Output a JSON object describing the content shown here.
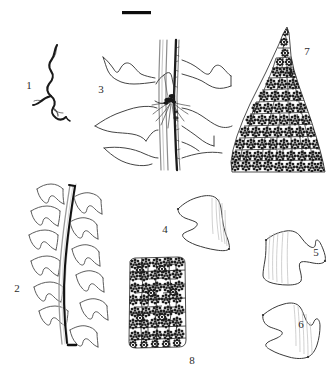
{
  "figure": {
    "kind": "scientific-illustration-plate",
    "caption_text": "",
    "background_color": "#ffffff",
    "ink_color": "#333333",
    "dark_ink_color": "#111111",
    "scale_bar": {
      "name": "scale-bar",
      "label": "",
      "x": 122,
      "y": 11,
      "width": 29,
      "height": 3,
      "color": "#0d0d0d"
    },
    "panels": [
      {
        "number": "1",
        "subject": "whole-plant-habit-sketch",
        "label_x": 29,
        "label_y": 89
      },
      {
        "number": "2",
        "subject": "stem-with-spreading-leaves",
        "label_x": 17,
        "label_y": 292
      },
      {
        "number": "3",
        "subject": "stem-portion-with-leaves-and-rhizoids",
        "label_x": 101,
        "label_y": 93
      },
      {
        "number": "4",
        "subject": "leaf-outline",
        "label_x": 165,
        "label_y": 233
      },
      {
        "number": "5",
        "subject": "leaf-outline",
        "label_x": 316,
        "label_y": 256
      },
      {
        "number": "6",
        "subject": "leaf-outline",
        "label_x": 301,
        "label_y": 328
      },
      {
        "number": "7",
        "subject": "leaf-apex-cell-areolation",
        "label_x": 307,
        "label_y": 55
      },
      {
        "number": "8",
        "subject": "median-leaf-cell-areolation",
        "label_x": 192,
        "label_y": 364
      }
    ]
  }
}
